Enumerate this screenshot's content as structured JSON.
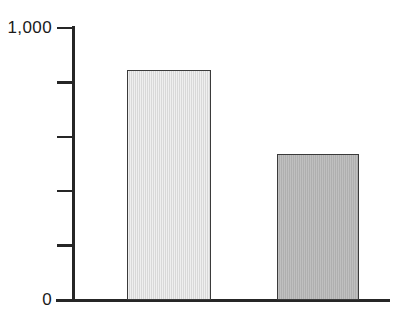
{
  "chart_data": {
    "type": "bar",
    "title": "",
    "subtitle": "",
    "xlabel": "",
    "ylabel": "",
    "categories": [
      "",
      ""
    ],
    "values": [
      845,
      535
    ],
    "series": [
      {
        "name": "",
        "values": [
          845,
          535
        ],
        "colors": [
          "#dcdcdc",
          "#b2b2b2"
        ]
      }
    ],
    "ylim": [
      0,
      1000
    ],
    "xlim": [
      0,
      2
    ],
    "y_ticks": [
      0,
      200,
      400,
      600,
      800,
      1000
    ],
    "y_tick_labels": [
      "0",
      "",
      "",
      "",
      "",
      "1,000"
    ],
    "y_tick_labels_shown": [
      "0",
      "1,000"
    ],
    "x_tick_labels": [],
    "grid": false,
    "legend": false,
    "legend_position": "none",
    "annotations": [],
    "bar_edge_color": "#3a3a3a",
    "axis_color": "#262626",
    "background_color": "#ffffff"
  },
  "axis": {
    "top_label": "1,000",
    "zero_label": "0"
  },
  "bars": [
    {
      "name": "bar-1",
      "value": 845,
      "fill": "#dcdcdc"
    },
    {
      "name": "bar-2",
      "value": 535,
      "fill": "#b2b2b2"
    }
  ]
}
